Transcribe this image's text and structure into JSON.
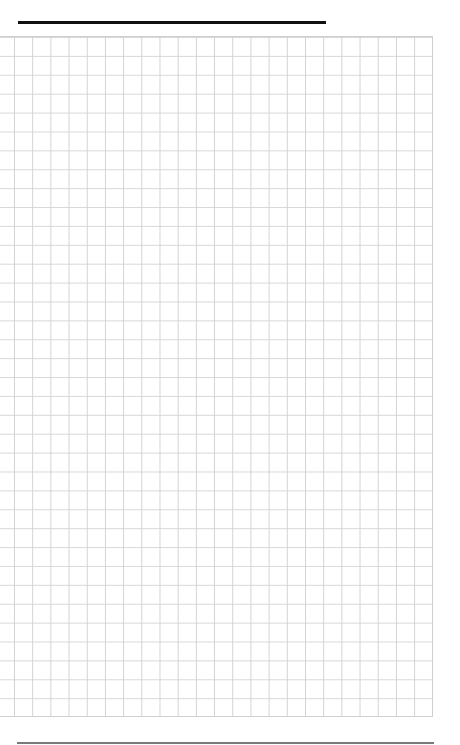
{
  "page": {
    "type": "graph-paper",
    "header_rule": {
      "color": "#111111"
    },
    "grid": {
      "columns": 23,
      "rows": 36,
      "line_color": "#d2d2d2"
    },
    "footer_rule": {
      "color": "#7a7a7a"
    }
  }
}
